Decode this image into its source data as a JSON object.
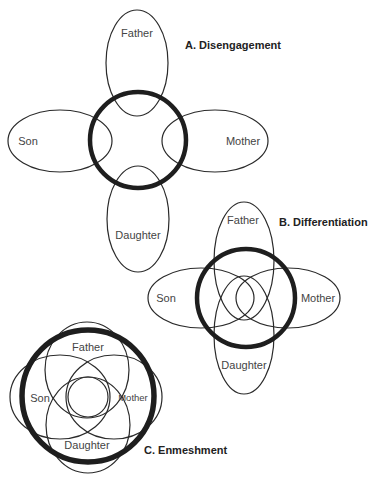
{
  "diagram": {
    "panels": [
      {
        "id": "A",
        "title": "A. Disengagement",
        "members": {
          "father": "Father",
          "mother": "Mother",
          "son": "Son",
          "daughter": "Daughter"
        }
      },
      {
        "id": "B",
        "title": "B. Differentiation",
        "members": {
          "father": "Father",
          "mother": "Mother",
          "son": "Son",
          "daughter": "Daughter"
        }
      },
      {
        "id": "C",
        "title": "C. Enmeshment",
        "members": {
          "father": "Father",
          "mother": "Mother",
          "son": "Son",
          "daughter": "Daughter"
        }
      }
    ],
    "colors": {
      "stroke": "#2a2a2a",
      "boundary": "#1e1e1e",
      "label": "#444444",
      "title": "#222222",
      "background": "#ffffff"
    }
  }
}
